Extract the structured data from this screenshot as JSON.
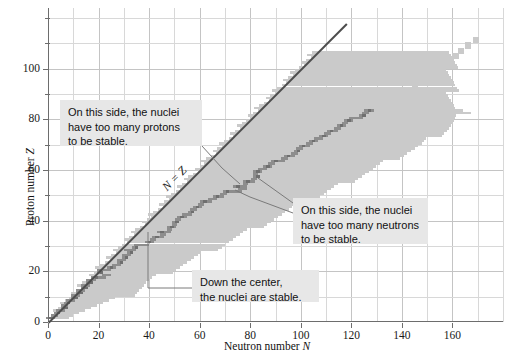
{
  "figure": {
    "kind": "nuclide-stability-chart",
    "background": "#ffffff"
  },
  "axes": {
    "x": {
      "title_prefix": "Neutron number ",
      "title_symbol": "N",
      "min": 0,
      "max": 180,
      "ticklabels": [
        "0",
        "20",
        "40",
        "60",
        "80",
        "100",
        "120",
        "140",
        "160"
      ],
      "tickvalues": [
        0,
        20,
        40,
        60,
        80,
        100,
        120,
        140,
        160
      ],
      "gridstep": 10
    },
    "y": {
      "title_prefix": "Proton number ",
      "title_symbol": "Z",
      "min": 0,
      "max": 124,
      "ticklabels": [
        "0",
        "20",
        "40",
        "60",
        "80",
        "100"
      ],
      "tickvalues": [
        0,
        20,
        40,
        60,
        80,
        100
      ],
      "gridstep": 10
    },
    "grid": "on",
    "grid_color": "#d8d8d8",
    "axis_color": "#6d6d6d"
  },
  "reference_line": {
    "label": "N = Z",
    "color": "#4d4d4d",
    "from": {
      "x": 0,
      "y": 0
    },
    "to": {
      "x": 118,
      "y": 118
    }
  },
  "annotations": [
    {
      "id": "too-many-protons",
      "text": "On this side, the nuclei have too many protons to be stable.",
      "lines": [
        "On this side, the nuclei",
        "have too many protons",
        "to be stable."
      ],
      "box": {
        "left": 60,
        "top": 100,
        "width": 142,
        "height": 46
      }
    },
    {
      "id": "too-many-neutrons",
      "text": "On this side, the nuclei have too many neutrons to be stable.",
      "lines": [
        "On this side, the nuclei",
        "have too many neutrons",
        "to be stable."
      ],
      "box": {
        "left": 293,
        "top": 198,
        "width": 135,
        "height": 46
      }
    },
    {
      "id": "stable-center",
      "text": "Down the center, the nuclei are stable.",
      "lines": [
        "Down the center,",
        "the nuclei are stable."
      ],
      "box": {
        "left": 192,
        "top": 270,
        "width": 127,
        "height": 32
      }
    }
  ],
  "legend_semantics": {
    "unstable_color": "#cacaca",
    "stable_color": "#8d8d8d",
    "unstable_meaning": "radioactive / unstable nuclides",
    "stable_meaning": "stable nuclides"
  },
  "chart_data": {
    "type": "scatter",
    "title": "",
    "xlabel": "Neutron number N",
    "ylabel": "Proton number Z",
    "xlim": [
      0,
      180
    ],
    "ylim": [
      0,
      124
    ],
    "grid": true,
    "legend_position": "none",
    "annotations": [
      "On this side, the nuclei have too many protons to be stable.",
      "On this side, the nuclei have too many neutrons to be stable.",
      "Down the center, the nuclei are stable.",
      "N = Z"
    ],
    "series": [
      {
        "name": "stable nuclides (valley of stability)",
        "color": "#8d8d8d",
        "comment": "Z vs N for the stable band; sampled every 2 in Z",
        "points": [
          [
            0,
            1
          ],
          [
            2,
            2
          ],
          [
            3,
            3
          ],
          [
            4,
            4
          ],
          [
            6,
            5
          ],
          [
            6,
            6
          ],
          [
            7,
            7
          ],
          [
            8,
            8
          ],
          [
            10,
            9
          ],
          [
            10,
            10
          ],
          [
            12,
            11
          ],
          [
            12,
            12
          ],
          [
            14,
            13
          ],
          [
            14,
            14
          ],
          [
            16,
            15
          ],
          [
            16,
            16
          ],
          [
            18,
            17
          ],
          [
            22,
            18
          ],
          [
            20,
            19
          ],
          [
            20,
            20
          ],
          [
            24,
            21
          ],
          [
            26,
            22
          ],
          [
            28,
            23
          ],
          [
            28,
            24
          ],
          [
            30,
            25
          ],
          [
            30,
            26
          ],
          [
            32,
            27
          ],
          [
            31,
            28
          ],
          [
            34,
            29
          ],
          [
            35,
            30
          ],
          [
            39,
            31
          ],
          [
            41,
            32
          ],
          [
            42,
            33
          ],
          [
            45,
            34
          ],
          [
            44,
            35
          ],
          [
            48,
            36
          ],
          [
            48,
            37
          ],
          [
            50,
            38
          ],
          [
            50,
            39
          ],
          [
            51,
            40
          ],
          [
            52,
            41
          ],
          [
            54,
            42
          ],
          [
            56,
            43
          ],
          [
            57,
            44
          ],
          [
            58,
            45
          ],
          [
            60,
            46
          ],
          [
            61,
            47
          ],
          [
            64,
            48
          ],
          [
            66,
            49
          ],
          [
            69,
            50
          ],
          [
            70,
            51
          ],
          [
            76,
            52
          ],
          [
            74,
            53
          ],
          [
            78,
            54
          ],
          [
            78,
            55
          ],
          [
            81,
            56
          ],
          [
            82,
            57
          ],
          [
            82,
            58
          ],
          [
            82,
            59
          ],
          [
            84,
            60
          ],
          [
            86,
            61
          ],
          [
            88,
            62
          ],
          [
            89,
            63
          ],
          [
            93,
            64
          ],
          [
            94,
            65
          ],
          [
            97,
            66
          ],
          [
            98,
            67
          ],
          [
            99,
            68
          ],
          [
            100,
            69
          ],
          [
            103,
            70
          ],
          [
            104,
            71
          ],
          [
            106,
            72
          ],
          [
            108,
            73
          ],
          [
            110,
            74
          ],
          [
            111,
            75
          ],
          [
            114,
            76
          ],
          [
            115,
            77
          ],
          [
            117,
            78
          ],
          [
            118,
            79
          ],
          [
            120,
            80
          ],
          [
            124,
            81
          ],
          [
            125,
            82
          ],
          [
            126,
            83
          ]
        ]
      },
      {
        "name": "known unstable nuclides (halo)",
        "color": "#cacaca",
        "comment": "envelope of the broad light-gray region: lower edge (proton-rich) and upper edge (neutron-rich) of known isotopes",
        "lower_edge": [
          [
            0,
            1
          ],
          [
            1,
            2
          ],
          [
            2,
            3
          ],
          [
            3,
            4
          ],
          [
            4,
            5
          ],
          [
            5,
            6
          ],
          [
            6,
            7
          ],
          [
            7,
            8
          ],
          [
            8,
            9
          ],
          [
            9,
            10
          ],
          [
            11,
            12
          ],
          [
            13,
            14
          ],
          [
            15,
            16
          ],
          [
            17,
            18
          ],
          [
            19,
            20
          ],
          [
            21,
            22
          ],
          [
            23,
            24
          ],
          [
            25,
            26
          ],
          [
            28,
            29
          ],
          [
            31,
            32
          ],
          [
            34,
            35
          ],
          [
            37,
            38
          ],
          [
            40,
            41
          ],
          [
            43,
            44
          ],
          [
            46,
            47
          ],
          [
            49,
            50
          ],
          [
            53,
            54
          ],
          [
            57,
            58
          ],
          [
            61,
            62
          ],
          [
            65,
            66
          ],
          [
            69,
            70
          ],
          [
            73,
            74
          ],
          [
            78,
            79
          ],
          [
            83,
            84
          ],
          [
            88,
            89
          ],
          [
            93,
            94
          ],
          [
            99,
            100
          ],
          [
            105,
            106
          ],
          [
            112,
            113
          ],
          [
            119,
            120
          ],
          [
            126,
            124
          ]
        ],
        "upper_edge": [
          [
            6,
            1
          ],
          [
            8,
            2
          ],
          [
            11,
            3
          ],
          [
            14,
            4
          ],
          [
            17,
            5
          ],
          [
            20,
            6
          ],
          [
            23,
            7
          ],
          [
            26,
            8
          ],
          [
            29,
            9
          ],
          [
            32,
            10
          ],
          [
            35,
            12
          ],
          [
            38,
            14
          ],
          [
            41,
            16
          ],
          [
            45,
            18
          ],
          [
            49,
            20
          ],
          [
            53,
            22
          ],
          [
            57,
            24
          ],
          [
            61,
            26
          ],
          [
            65,
            28
          ],
          [
            69,
            30
          ],
          [
            73,
            32
          ],
          [
            77,
            34
          ],
          [
            81,
            36
          ],
          [
            85,
            38
          ],
          [
            89,
            40
          ],
          [
            93,
            42
          ],
          [
            97,
            44
          ],
          [
            101,
            46
          ],
          [
            105,
            48
          ],
          [
            109,
            50
          ],
          [
            113,
            52
          ],
          [
            117,
            54
          ],
          [
            121,
            56
          ],
          [
            125,
            58
          ],
          [
            129,
            60
          ],
          [
            133,
            62
          ],
          [
            137,
            64
          ],
          [
            141,
            66
          ],
          [
            145,
            68
          ],
          [
            149,
            70
          ],
          [
            152,
            72
          ],
          [
            155,
            74
          ],
          [
            158,
            76
          ],
          [
            161,
            78
          ],
          [
            163,
            80
          ],
          [
            165,
            82
          ],
          [
            160,
            84
          ]
        ]
      },
      {
        "name": "superheavy / isolated nuclides",
        "color": "#cacaca",
        "points": [
          [
            144,
            92
          ],
          [
            148,
            95
          ],
          [
            150,
            96
          ],
          [
            153,
            99
          ],
          [
            157,
            103
          ],
          [
            160,
            104
          ],
          [
            162,
            106
          ],
          [
            165,
            108
          ],
          [
            168,
            110
          ],
          [
            151,
            90
          ],
          [
            146,
            88
          ]
        ]
      }
    ]
  }
}
